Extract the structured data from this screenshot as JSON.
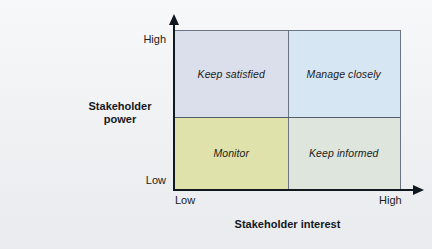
{
  "chart_data": {
    "type": "table",
    "title": "",
    "xlabel": "Stakeholder interest",
    "ylabel": "Stakeholder power",
    "x_ticks": [
      "Low",
      "High"
    ],
    "y_ticks": [
      "Low",
      "High"
    ],
    "grid": false,
    "legend": "none",
    "quadrants": [
      {
        "id": "keep-satisfied",
        "label": "Keep satisfied",
        "x": "Low",
        "y": "High",
        "color": "#dadfeb"
      },
      {
        "id": "manage-closely",
        "label": "Manage closely",
        "x": "High",
        "y": "High",
        "color": "#d6e6f2"
      },
      {
        "id": "monitor",
        "label": "Monitor",
        "x": "Low",
        "y": "Low",
        "color": "#dfe3ab"
      },
      {
        "id": "keep-informed",
        "label": "Keep informed",
        "x": "High",
        "y": "Low",
        "color": "#dde5dc"
      }
    ]
  },
  "axes": {
    "y": {
      "title_line1": "Stakeholder",
      "title_line2": "power",
      "high": "High",
      "low": "Low"
    },
    "x": {
      "title": "Stakeholder interest",
      "low": "Low",
      "high": "High"
    }
  },
  "colors": {
    "background": "#eef0f2",
    "frame": "#6b7480",
    "axis": "#12181f",
    "text": "#1b1b1b",
    "quad_keep_satisfied": "#dadfeb",
    "quad_manage_closely": "#d6e6f2",
    "quad_monitor": "#dfe3ab",
    "quad_keep_informed": "#dde5dc"
  }
}
